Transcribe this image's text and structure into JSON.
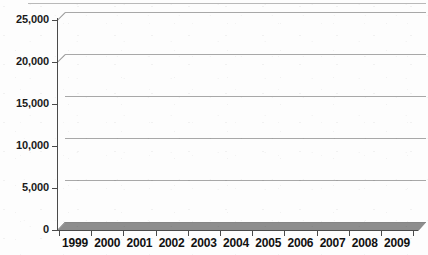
{
  "chart_data": {
    "type": "bar",
    "title": "",
    "subtitle": "",
    "xlabel": "",
    "ylabel": "",
    "categories": [
      "1999",
      "2000",
      "2001",
      "2002",
      "2003",
      "2004",
      "2005",
      "2006",
      "2007",
      "2008",
      "2009"
    ],
    "values": [
      15719,
      18857,
      19647,
      21378,
      21654,
      22990,
      22734,
      20680,
      19609,
      17475,
      12753
    ],
    "value_labels": [
      "15,719",
      "18,857",
      "19,647",
      "21,378",
      "21,654",
      "22,990",
      "22,734",
      "20,680",
      "19,609",
      "17,475",
      "12,753"
    ],
    "ylim": [
      0,
      25000
    ],
    "ytick_values": [
      0,
      5000,
      10000,
      15000,
      20000,
      25000
    ],
    "ytick_labels": [
      "0",
      "5,000",
      "10,000",
      "15,000",
      "20,000",
      "25,000"
    ],
    "grid": true,
    "legend": "none",
    "series": [
      {
        "name": "",
        "values": [
          15719,
          18857,
          19647,
          21378,
          21654,
          22990,
          22734,
          20680,
          19609,
          17475,
          12753
        ]
      }
    ],
    "style": {
      "bar_color": "#121212",
      "bar_side_color": "#2a2a2a",
      "bar_top_color": "#1d1d1d",
      "floor_color": "#8d8d8d",
      "gridline_color": "#a8a8a8",
      "axis_color": "#4a4a4a",
      "background": "#fdfdfd",
      "text_color": "#111111",
      "three_d": true
    }
  }
}
